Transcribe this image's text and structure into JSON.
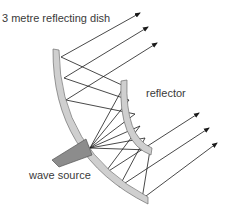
{
  "labels": {
    "dish": "3 metre reflecting dish",
    "reflector": "reflector",
    "source": "wave source"
  },
  "colors": {
    "reflector_fill": "#cfcfcf",
    "reflector_stroke": "#6e6e6e",
    "source_fill": "#8c8c8c",
    "ray": "#1a1a1a",
    "text": "#3a3a3a"
  },
  "diagram": {
    "components": [
      "3 metre reflecting dish",
      "reflector",
      "wave source"
    ],
    "outgoing_ray_count": 6
  }
}
